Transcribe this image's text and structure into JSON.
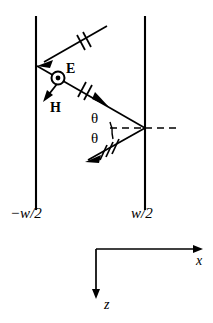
{
  "figure": {
    "kind": "waveguide-ray-diagram",
    "stroke_color": "#000000",
    "background_color": "#ffffff",
    "width": 213,
    "height": 323
  },
  "walls": {
    "left": {
      "label": "−w/2",
      "x": 36,
      "y_top": 16,
      "y_bottom": 210
    },
    "right": {
      "label": "w/2",
      "x": 145,
      "y_top": 16,
      "y_bottom": 210
    }
  },
  "fields": {
    "e_label": "E",
    "e_symbol": "out-of-page-dot",
    "h_label": "H"
  },
  "angles": {
    "upper_label": "θ",
    "lower_label": "θ"
  },
  "axes": {
    "x_label": "x",
    "z_label": "z"
  },
  "rays": {
    "incident": {
      "tick_count": 2,
      "direction": "down-left"
    },
    "reflected_middle": {
      "tick_count": 2,
      "direction": "down-right"
    },
    "reflected_lower": {
      "tick_count": 3,
      "direction": "down-left"
    }
  }
}
